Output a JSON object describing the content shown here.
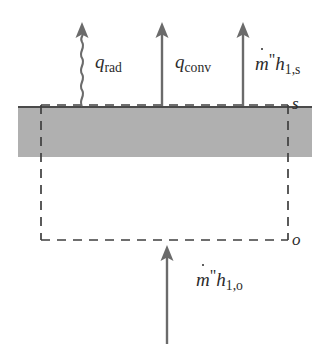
{
  "figure": {
    "background_color": "#ffffff",
    "width": 329,
    "height": 344
  },
  "colors": {
    "slab_fill": "#b0b0b0",
    "slab_top_edge": "#4a4a4a",
    "line": "#5a5a5a",
    "dashed_line": "#4a4a4a",
    "text": "#2b2b2b",
    "arrow": "#6b6b6b"
  },
  "slab": {
    "name": "liquid-layer",
    "x": 18,
    "y": 106,
    "width": 294,
    "height": 51,
    "top_edge_label": "s"
  },
  "control_volume": {
    "name": "dashed-control-volume",
    "x": 41,
    "y": 105,
    "width": 247,
    "height": 135,
    "style": "dashed",
    "top_boundary_label": "s",
    "bottom_boundary_label": "o"
  },
  "boundary_labels": [
    {
      "id": "surface-s",
      "text": "s",
      "position": "top-right",
      "meaning": "surface state"
    },
    {
      "id": "outer-o",
      "text": "o",
      "position": "bottom-right",
      "meaning": "outer/bulk state"
    }
  ],
  "arrows": [
    {
      "id": "q-rad",
      "style": "wavy",
      "direction": "up",
      "shaft_x": 82,
      "tip_y": 24,
      "tail_y": 106,
      "label": {
        "base": "q",
        "subscript": "rad"
      }
    },
    {
      "id": "q-conv",
      "style": "straight",
      "direction": "up",
      "shaft_x": 162,
      "tip_y": 24,
      "tail_y": 106,
      "label": {
        "base": "q",
        "subscript": "conv"
      }
    },
    {
      "id": "mdot-h1s",
      "style": "straight",
      "direction": "up",
      "shaft_x": 243,
      "tip_y": 24,
      "tail_y": 106,
      "label": {
        "base": "m",
        "accent": "dot",
        "prime": "\"",
        "term": "h",
        "subscript": "1,s"
      }
    },
    {
      "id": "mdot-h1o",
      "style": "straight",
      "direction": "up",
      "shaft_x": 167,
      "tip_y": 246,
      "tail_y": 344,
      "label": {
        "base": "m",
        "accent": "dot",
        "prime": "\"",
        "term": "h",
        "subscript": "1,o"
      }
    }
  ],
  "labels": {
    "q_rad": {
      "base": "q",
      "subscript": "rad"
    },
    "q_conv": {
      "base": "q",
      "subscript": "conv"
    },
    "mdot_h1s": {
      "m": "m",
      "prime": "\"",
      "h": "h",
      "subscript": "1,s"
    },
    "mdot_h1o": {
      "m": "m",
      "prime": "\"",
      "h": "h",
      "subscript": "1,o"
    },
    "surface_s": "s",
    "outer_o": "o"
  }
}
